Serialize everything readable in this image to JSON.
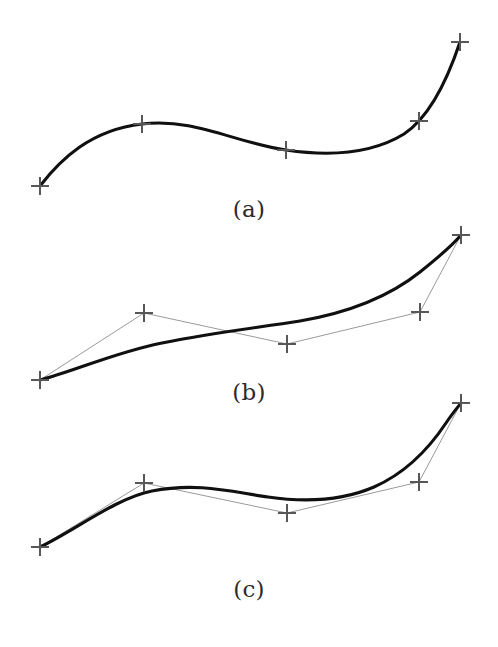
{
  "figure": {
    "background_color": "#ffffff",
    "width": 498,
    "height": 647,
    "curve_color": "#101010",
    "curve_width": 3.1,
    "polygon_color": "#9a9a9a",
    "polygon_width": 1.0,
    "marker_color": "#575757",
    "marker_width": 2.0,
    "marker_arm": 9
  },
  "panels": [
    {
      "id": "a",
      "caption": "(a)",
      "caption_y": 198,
      "show_control_polygon": false,
      "control_points": [
        {
          "x": 40,
          "y": 186
        },
        {
          "x": 142,
          "y": 124
        },
        {
          "x": 286,
          "y": 150
        },
        {
          "x": 419,
          "y": 121
        },
        {
          "x": 460,
          "y": 42
        }
      ],
      "curve_path": "M 40 186 C 60 160 90 130 142 124 C 196 118 232 142 286 150 C 340 158 378 150 404 134 C 428 118 446 84 460 42"
    },
    {
      "id": "b",
      "caption": "(b)",
      "caption_y": 381,
      "show_control_polygon": true,
      "control_points": [
        {
          "x": 40,
          "y": 380
        },
        {
          "x": 144,
          "y": 313
        },
        {
          "x": 287,
          "y": 344
        },
        {
          "x": 420,
          "y": 312
        },
        {
          "x": 461,
          "y": 235
        }
      ],
      "curve_path": "M 40 380 C 72 372 116 352 162 343 C 216 332 256 328 300 321 C 352 312 390 296 420 272 C 440 256 452 246 461 235"
    },
    {
      "id": "c",
      "caption": "(c)",
      "caption_y": 578,
      "show_control_polygon": true,
      "control_points": [
        {
          "x": 40,
          "y": 547
        },
        {
          "x": 144,
          "y": 483
        },
        {
          "x": 287,
          "y": 513
        },
        {
          "x": 419,
          "y": 482
        },
        {
          "x": 461,
          "y": 403
        }
      ],
      "curve_path": "M 40 547 C 74 531 116 498 152 491 C 198 482 232 492 268 497 C 310 503 344 500 374 487 C 408 472 432 444 446 423 C 452 414 457 408 461 403"
    }
  ]
}
